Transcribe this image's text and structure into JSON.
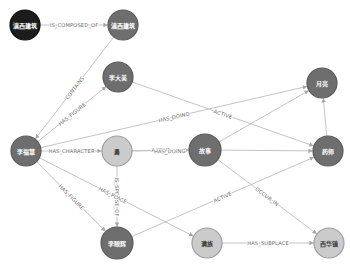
{
  "colors": {
    "root_fill": "#1c1c1c",
    "root_stroke": "#0a0a0a",
    "entity_fill": "#6e6e6e",
    "entity_stroke": "#5a5a5a",
    "attribute_fill": "#cbcbcb",
    "attribute_stroke": "#9e9e9e",
    "edge": "#bdbdbd",
    "light_text": "#ffffff",
    "dark_text": "#3a3a3a"
  },
  "diagram": {
    "nodes": [
      {
        "id": "n1",
        "label": "滇西建筑",
        "kind": "root",
        "x": 25,
        "y": 25,
        "r": 15
      },
      {
        "id": "n2",
        "label": "滇西建筑",
        "kind": "entity",
        "x": 123,
        "y": 25,
        "r": 15
      },
      {
        "id": "n3",
        "label": "李大美",
        "kind": "entity",
        "x": 118,
        "y": 77,
        "r": 15
      },
      {
        "id": "n4",
        "label": "李福慧",
        "kind": "entity",
        "x": 26,
        "y": 151,
        "r": 15
      },
      {
        "id": "n5",
        "label": "勇",
        "kind": "attribute",
        "x": 117,
        "y": 151,
        "r": 15
      },
      {
        "id": "n6",
        "label": "故事",
        "kind": "entity",
        "x": 205,
        "y": 150,
        "r": 16
      },
      {
        "id": "n7",
        "label": "月亮",
        "kind": "entity",
        "x": 322,
        "y": 83,
        "r": 15
      },
      {
        "id": "n8",
        "label": "药师",
        "kind": "entity",
        "x": 328,
        "y": 151,
        "r": 15
      },
      {
        "id": "n9",
        "label": "李颐辉",
        "kind": "entity",
        "x": 117,
        "y": 243,
        "r": 16
      },
      {
        "id": "n10",
        "label": "满族",
        "kind": "attribute",
        "x": 207,
        "y": 243,
        "r": 15
      },
      {
        "id": "n11",
        "label": "西华镇",
        "kind": "attribute",
        "x": 329,
        "y": 243,
        "r": 15
      }
    ],
    "edges": [
      {
        "from": "n1",
        "to": "n2",
        "label": "IS_COMPOSED_OF"
      },
      {
        "from": "n2",
        "to": "n4",
        "label": "CONTAINS"
      },
      {
        "from": "n4",
        "to": "n3",
        "label": "HAS_FIGURE"
      },
      {
        "from": "n3",
        "to": "n8",
        "label": "ACTIVE"
      },
      {
        "from": "n4",
        "to": "n7",
        "label": "HAS_DOING"
      },
      {
        "from": "n4",
        "to": "n5",
        "label": "HAS_CHARACTER"
      },
      {
        "from": "n5",
        "to": "n6",
        "label": "ACTIVE",
        "dy": -0.6
      },
      {
        "from": "n5",
        "to": "n6",
        "label": "HAS_DOING",
        "t": 0.6,
        "dy": 0.8
      },
      {
        "from": "n4",
        "to": "n9",
        "label": "HAS_FIGURE"
      },
      {
        "from": "n5",
        "to": "n9",
        "label": "IS_SPOUSE_OF"
      },
      {
        "from": "n4",
        "to": "n10",
        "label": "HAS_PLACE",
        "t": 0.48
      },
      {
        "from": "n9",
        "to": "n8",
        "label": "ACTIVE"
      },
      {
        "from": "n6",
        "to": "n7",
        "label": ""
      },
      {
        "from": "n6",
        "to": "n8",
        "label": ""
      },
      {
        "from": "n8",
        "to": "n7",
        "label": ""
      },
      {
        "from": "n6",
        "to": "n11",
        "label": "OCCUR_IN"
      },
      {
        "from": "n10",
        "to": "n11",
        "label": "HAS_SUBPLACE"
      }
    ]
  }
}
